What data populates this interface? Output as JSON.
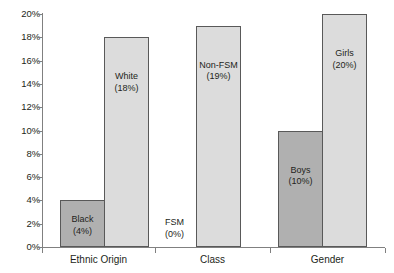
{
  "chart_data": {
    "type": "bar",
    "title": "",
    "subtitle": "",
    "xlabel": "",
    "ylabel": "",
    "ylim": [
      0,
      20
    ],
    "yunit": "%",
    "grid": false,
    "legend": "none",
    "y_ticks": [
      "0%",
      "2%",
      "4%",
      "6%",
      "8%",
      "10%",
      "12%",
      "14%",
      "16%",
      "18%",
      "20%"
    ],
    "y_tick_values": [
      0,
      2,
      4,
      6,
      8,
      10,
      12,
      14,
      16,
      18,
      20
    ],
    "categories": [
      "Ethnic Origin",
      "Class",
      "Gender"
    ],
    "bars": [
      {
        "name": "Black",
        "value": 4,
        "label": "Black",
        "value_label": "(4%)",
        "group": "Ethnic Origin",
        "shade": "dark"
      },
      {
        "name": "White",
        "value": 18,
        "label": "White",
        "value_label": "(18%)",
        "group": "Ethnic Origin",
        "shade": "light"
      },
      {
        "name": "FSM",
        "value": 0,
        "label": "FSM",
        "value_label": "(0%)",
        "group": "Class",
        "shade": "dark"
      },
      {
        "name": "Non-FSM",
        "value": 19,
        "label": "Non-FSM",
        "value_label": "(19%)",
        "group": "Class",
        "shade": "light"
      },
      {
        "name": "Boys",
        "value": 10,
        "label": "Boys",
        "value_label": "(10%)",
        "group": "Gender",
        "shade": "dark"
      },
      {
        "name": "Girls",
        "value": 20,
        "label": "Girls",
        "value_label": "(20%)",
        "group": "Gender",
        "shade": "light"
      }
    ],
    "colors": {
      "bar_light": "#dcdcdc",
      "bar_dark": "#b0b0b0",
      "bar_border": "#595959",
      "axis": "#808080",
      "text": "#231f20",
      "background": "#ffffff"
    }
  }
}
